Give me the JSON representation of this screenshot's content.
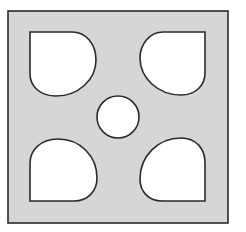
{
  "diagram": {
    "colors": {
      "plate_fill": "#d6d6d6",
      "stroke": "#2a2a2a",
      "hole_fill": "#ffffff",
      "background": "#ffffff"
    },
    "plate": {
      "x": 8,
      "y": 11,
      "width": 220,
      "height": 212
    },
    "holes": [
      {
        "name": "top-left",
        "square_corner": "top-left",
        "x": 30,
        "y": 32,
        "w": 66,
        "h": 64
      },
      {
        "name": "top-right",
        "square_corner": "top-right",
        "x": 140,
        "y": 32,
        "w": 65,
        "h": 63
      },
      {
        "name": "bottom-left",
        "square_corner": "bottom-left",
        "x": 30,
        "y": 139,
        "w": 67,
        "h": 62
      },
      {
        "name": "bottom-right",
        "square_corner": "bottom-right",
        "x": 140,
        "y": 138,
        "w": 65,
        "h": 63
      }
    ],
    "center_hole": {
      "cx": 118,
      "cy": 117,
      "r": 21
    }
  }
}
